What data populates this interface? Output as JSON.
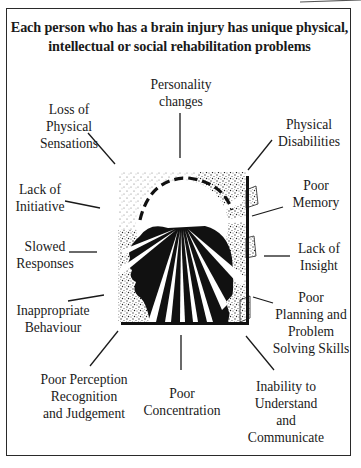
{
  "title": {
    "line1": "Each person who has a brain injury has unique physical,",
    "line2": "intellectual or social rehabilitation problems"
  },
  "center_image": {
    "icon": "brain-injury-head-icon",
    "description": "Stippled square with dark head silhouette in profile, dashed arc over skull and radiating light rays"
  },
  "labels": [
    {
      "id": "personality-changes",
      "lines": [
        "Personality",
        "changes"
      ]
    },
    {
      "id": "physical-disabilities",
      "lines": [
        "Physical",
        "Disabilities"
      ]
    },
    {
      "id": "poor-memory",
      "lines": [
        "Poor",
        "Memory"
      ]
    },
    {
      "id": "lack-of-insight",
      "lines": [
        "Lack of",
        "Insight"
      ]
    },
    {
      "id": "poor-planning",
      "lines": [
        "Poor",
        "Planning and",
        "Problem",
        "Solving Skills"
      ]
    },
    {
      "id": "inability-to-understand",
      "lines": [
        "Inability to",
        "Understand",
        "and",
        "Communicate"
      ]
    },
    {
      "id": "poor-concentration",
      "lines": [
        "Poor",
        "Concentration"
      ]
    },
    {
      "id": "poor-perception",
      "lines": [
        "Poor Perception",
        "Recognition",
        "and Judgement"
      ]
    },
    {
      "id": "inappropriate-behaviour",
      "lines": [
        "Inappropriate",
        "Behaviour"
      ]
    },
    {
      "id": "slowed-responses",
      "lines": [
        "Slowed",
        "Responses"
      ]
    },
    {
      "id": "lack-of-initiative",
      "lines": [
        "Lack of",
        "Initiative"
      ]
    },
    {
      "id": "loss-of-physical-sensations",
      "lines": [
        "Loss of",
        "Physical",
        "Sensations"
      ]
    }
  ],
  "colors": {
    "ink": "#1a1a1a",
    "paper": "#ffffff",
    "stipple": "#8a8a8a"
  }
}
